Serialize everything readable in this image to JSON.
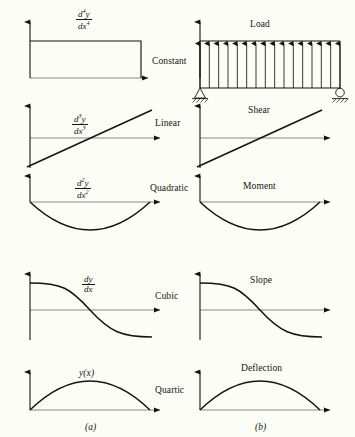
{
  "figure": {
    "background_color": "#fdfdf8",
    "ink_color": "#15140f",
    "captions": {
      "left": "(a)",
      "right": "(b)"
    }
  },
  "chart_data": {
    "type": "line",
    "xlabel": "",
    "ylabel": "",
    "grid": false,
    "legend_position": "none",
    "panel_columns": [
      {
        "key": "a",
        "caption": "(a)",
        "description": "mathematical derivative form"
      },
      {
        "key": "b",
        "caption": "(b)",
        "description": "physical beam quantity"
      }
    ],
    "rows": [
      {
        "order": 4,
        "left_label_html": "d4y/dx4",
        "left_label": "d⁴y/dx⁴",
        "middle_label": "Constant",
        "right_label": "Load",
        "shape": "constant",
        "x": [
          0,
          1
        ],
        "values": [
          1,
          1
        ],
        "note": "Uniform distributed load; rectangle of constant height"
      },
      {
        "order": 3,
        "left_label_html": "d3y/dx3",
        "left_label": "d³y/dx³",
        "middle_label": "Linear",
        "right_label": "Shear",
        "shape": "linear",
        "x": [
          0,
          0.5,
          1
        ],
        "values": [
          -1,
          0,
          1
        ],
        "note": "Straight line crossing zero at midspan"
      },
      {
        "order": 2,
        "left_label_html": "d2y/dx2",
        "left_label": "d²y/dx²",
        "middle_label": "Quadratic",
        "right_label": "Moment",
        "shape": "quadratic",
        "x": [
          0,
          0.25,
          0.5,
          0.75,
          1
        ],
        "values": [
          0,
          -0.75,
          -1,
          -0.75,
          0
        ],
        "note": "Downward parabola, zero at both supports, minimum at midspan"
      },
      {
        "order": 1,
        "left_label_html": "dy/dx",
        "left_label": "dy/dx",
        "middle_label": "Cubic",
        "right_label": "Slope",
        "shape": "cubic",
        "x": [
          0,
          0.25,
          0.5,
          0.75,
          1
        ],
        "values": [
          1,
          0.85,
          0,
          -0.85,
          -1
        ],
        "note": "Descending S-curve crossing zero at midspan"
      },
      {
        "order": 0,
        "left_label_html": "y(x)",
        "left_label": "y(x)",
        "middle_label": "Quartic",
        "right_label": "Deflection",
        "shape": "quartic",
        "x": [
          0,
          0.25,
          0.5,
          0.75,
          1
        ],
        "values": [
          0,
          0.84,
          1,
          0.84,
          0
        ],
        "note": "Symmetric arch, zero at both supports, maximum at midspan"
      }
    ],
    "beam": {
      "load_arrow_count": 16,
      "load_direction": "upward",
      "left_support": "pin",
      "right_support": "roller"
    }
  },
  "labels": {
    "load": "Load",
    "shear": "Shear",
    "moment": "Moment",
    "slope": "Slope",
    "deflection": "Deflection",
    "constant": "Constant",
    "linear": "Linear",
    "quadratic": "Quadratic",
    "cubic": "Cubic",
    "quartic": "Quartic",
    "y_of_x": "y(x)",
    "caption_a": "(a)",
    "caption_b": "(b)",
    "frac": {
      "d4": {
        "num_d": "d",
        "num_sup": "4",
        "num_y": "y",
        "den_d": "dx",
        "den_sup": "4"
      },
      "d3": {
        "num_d": "d",
        "num_sup": "3",
        "num_y": "y",
        "den_d": "dx",
        "den_sup": "3"
      },
      "d2": {
        "num_d": "d",
        "num_sup": "2",
        "num_y": "y",
        "den_d": "dx",
        "den_sup": "2"
      },
      "d1": {
        "num": "dy",
        "den": "dx"
      }
    }
  }
}
